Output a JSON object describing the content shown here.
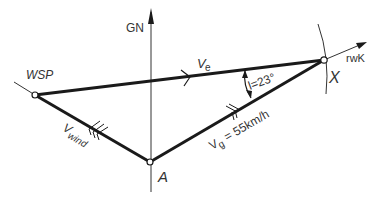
{
  "diagram": {
    "type": "wind-triangle",
    "labels": {
      "north_axis": "GN",
      "start_point": "WSP",
      "target_point": "X",
      "wind_point": "A",
      "track_course": "rwK",
      "airspeed_vector_main": "V",
      "airspeed_vector_sub": "e",
      "wind_vector_main": "V",
      "wind_vector_sub": "wind",
      "ground_vector_main": "V",
      "ground_vector_sub": "g",
      "ground_vector_value": " = 55km/h",
      "angle_label": "l=23°"
    },
    "values": {
      "ground_speed_kmh": 55,
      "angle_deg": 23
    },
    "colors": {
      "line": "#1a1a1a",
      "thin_line": "#333333",
      "background": "#ffffff"
    }
  }
}
